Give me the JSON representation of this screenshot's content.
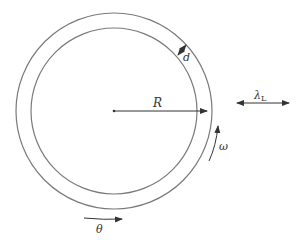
{
  "diagram": {
    "colors": {
      "stroke": "#7a7a7a",
      "arrow": "#333333",
      "text": "#333333"
    },
    "labels": {
      "radius": "R",
      "thickness": "d",
      "angular_velocity": "ω",
      "angle": "θ",
      "wavelength": "λ",
      "wavelength_subscript": "L"
    }
  }
}
